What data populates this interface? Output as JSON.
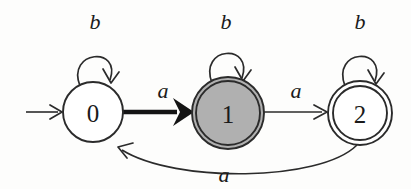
{
  "figure": {
    "kind": "finite-state-automaton",
    "background_color": "#fdfdfc",
    "ink_color": "#2b2b2b",
    "highlight_fill": "#b0b0b0",
    "highlight_edge_color": "#141414"
  },
  "states": [
    {
      "id": "0",
      "label": "0",
      "cx": 93,
      "cy": 112,
      "radius": 30,
      "accepting": false,
      "initial": true,
      "highlighted": false,
      "fill": "#ffffff"
    },
    {
      "id": "1",
      "label": "1",
      "cx": 228,
      "cy": 113,
      "radius": 36,
      "inner_radius": 32,
      "accepting": true,
      "initial": false,
      "highlighted": true,
      "fill": "#b0b0b0"
    },
    {
      "id": "2",
      "label": "2",
      "cx": 360,
      "cy": 113,
      "radius": 32,
      "inner_radius": 27,
      "accepting": true,
      "initial": false,
      "highlighted": false,
      "fill": "#ffffff"
    }
  ],
  "self_loops": [
    {
      "state": "0",
      "symbol": "b",
      "label_x": 95,
      "label_y": 21
    },
    {
      "state": "1",
      "symbol": "b",
      "label_x": 226,
      "label_y": 21
    },
    {
      "state": "2",
      "symbol": "b",
      "label_x": 360,
      "label_y": 21
    }
  ],
  "transitions": [
    {
      "from": "0",
      "to": "1",
      "symbol": "a",
      "label_x": 163,
      "label_y": 90,
      "emphasis": "bold",
      "shape": "straight"
    },
    {
      "from": "1",
      "to": "2",
      "symbol": "a",
      "label_x": 296,
      "label_y": 90,
      "emphasis": "normal",
      "shape": "straight"
    },
    {
      "from": "2",
      "to": "0",
      "symbol": "a",
      "label_x": 224,
      "label_y": 174,
      "emphasis": "normal",
      "shape": "curve-below"
    }
  ],
  "start_marker": {
    "symbol": "start-arrow",
    "from_x": 26,
    "to_x": 62,
    "y": 112
  }
}
